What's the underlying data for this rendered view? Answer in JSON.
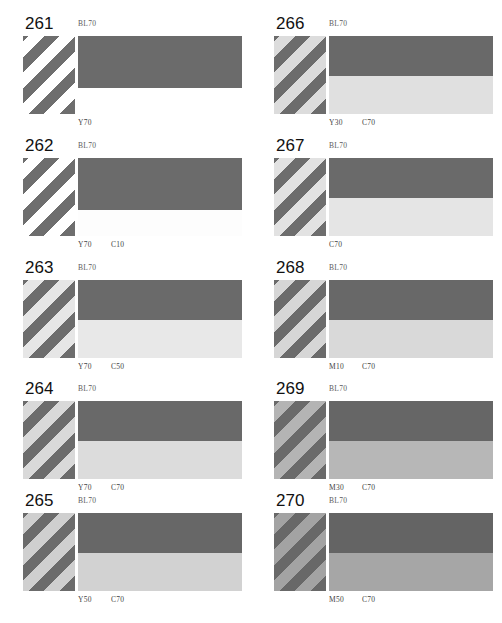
{
  "sheet": {
    "width": 502,
    "height": 623,
    "background": "#ffffff",
    "columns": 2,
    "rows": 5,
    "description_type": "ink-overprint-reference-chart"
  },
  "chart_data": {
    "type": "table",
    "title": "",
    "panel_count": 10,
    "panels": [
      {
        "number": "261",
        "top_label": "BL70",
        "bottom_labels": [
          "Y70"
        ],
        "stripe_dark": "#6e6e6e",
        "stripe_light": "#ffffff",
        "band_top_color": "#6b6b6b",
        "band_bottom_color": "#ffffff",
        "band_top_height": 52,
        "band_bottom_height": 52,
        "swatch_height": 78
      },
      {
        "number": "262",
        "top_label": "BL70",
        "bottom_labels": [
          "Y70",
          "C10"
        ],
        "stripe_dark": "#6e6e6e",
        "stripe_light": "#ffffff",
        "band_top_color": "#6b6b6b",
        "band_bottom_color": "#fdfdfd",
        "band_top_height": 52,
        "band_bottom_height": 26,
        "swatch_height": 78
      },
      {
        "number": "263",
        "top_label": "BL70",
        "bottom_labels": [
          "Y70",
          "C50"
        ],
        "stripe_dark": "#6d6d6d",
        "stripe_light": "#e6e6e6",
        "band_top_color": "#6a6a6a",
        "band_bottom_color": "#e8e8e8",
        "band_top_height": 40,
        "band_bottom_height": 38,
        "swatch_height": 78
      },
      {
        "number": "264",
        "top_label": "BL70",
        "bottom_labels": [
          "Y70",
          "C70"
        ],
        "stripe_dark": "#6c6c6c",
        "stripe_light": "#d9d9d9",
        "band_top_color": "#696969",
        "band_bottom_color": "#dcdcdc",
        "band_top_height": 40,
        "band_bottom_height": 38,
        "swatch_height": 78
      },
      {
        "number": "265",
        "top_label": "BL70",
        "bottom_labels": [
          "Y50",
          "C70"
        ],
        "stripe_dark": "#6b6b6b",
        "stripe_light": "#cfcfcf",
        "band_top_color": "#676767",
        "band_bottom_color": "#d2d2d2",
        "band_top_height": 40,
        "band_bottom_height": 38,
        "swatch_height": 78
      },
      {
        "number": "266",
        "top_label": "BL70",
        "bottom_labels": [
          "Y30",
          "C70"
        ],
        "stripe_dark": "#6c6c6c",
        "stripe_light": "#dcdcdc",
        "band_top_color": "#696969",
        "band_bottom_color": "#e0e0e0",
        "band_top_height": 40,
        "band_bottom_height": 38,
        "swatch_height": 78
      },
      {
        "number": "267",
        "top_label": "BL70",
        "bottom_labels": [
          "C70"
        ],
        "stripe_dark": "#6d6d6d",
        "stripe_light": "#e2e2e2",
        "band_top_color": "#6a6a6a",
        "band_bottom_color": "#e5e5e5",
        "band_top_height": 40,
        "band_bottom_height": 38,
        "swatch_height": 78
      },
      {
        "number": "268",
        "top_label": "BL70",
        "bottom_labels": [
          "M10",
          "C70"
        ],
        "stripe_dark": "#6b6b6b",
        "stripe_light": "#d6d6d6",
        "band_top_color": "#686868",
        "band_bottom_color": "#d9d9d9",
        "band_top_height": 40,
        "band_bottom_height": 38,
        "swatch_height": 78
      },
      {
        "number": "269",
        "top_label": "BL70",
        "bottom_labels": [
          "M30",
          "C70"
        ],
        "stripe_dark": "#6a6a6a",
        "stripe_light": "#b4b4b4",
        "band_top_color": "#666666",
        "band_bottom_color": "#b7b7b7",
        "band_top_height": 40,
        "band_bottom_height": 38,
        "swatch_height": 78
      },
      {
        "number": "270",
        "top_label": "BL70",
        "bottom_labels": [
          "M50",
          "C70"
        ],
        "stripe_dark": "#686868",
        "stripe_light": "#a3a3a3",
        "band_top_color": "#646464",
        "band_bottom_color": "#a6a6a6",
        "band_top_height": 40,
        "band_bottom_height": 38,
        "swatch_height": 78
      }
    ]
  }
}
